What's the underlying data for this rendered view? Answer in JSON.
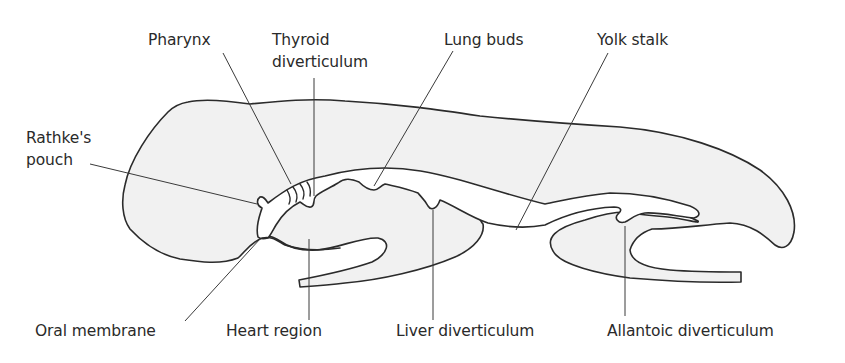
{
  "diagram": {
    "colors": {
      "tissue_fill": "#f1f1f1",
      "outline": "#2b2b2b",
      "background": "#ffffff",
      "text": "#2a2a2a"
    },
    "labels": {
      "pharynx": "Pharynx",
      "thyroid_line1": "Thyroid",
      "thyroid_line2": "diverticulum",
      "lung_buds": "Lung buds",
      "yolk_stalk": "Yolk stalk",
      "rathke_line1": "Rathke's",
      "rathke_line2": "pouch",
      "oral_membrane": "Oral membrane",
      "heart_region": "Heart region",
      "liver_diverticulum": "Liver diverticulum",
      "allantoic_diverticulum": "Allantoic diverticulum"
    },
    "top_labels": [
      "Pharynx",
      "Thyroid diverticulum",
      "Lung buds",
      "Yolk stalk"
    ],
    "left_labels": [
      "Rathke's pouch"
    ],
    "bottom_labels": [
      "Oral membrane",
      "Heart region",
      "Liver diverticulum",
      "Allantoic diverticulum"
    ]
  }
}
